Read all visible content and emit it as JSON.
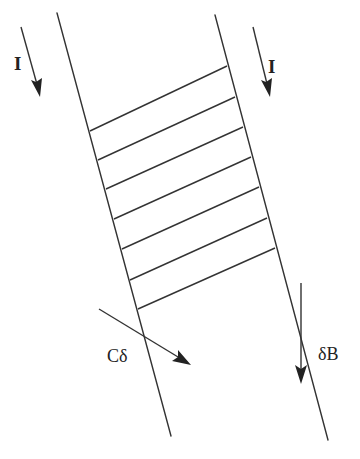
{
  "diagram": {
    "colors": {
      "stroke": "#333333",
      "background": "#ffffff"
    },
    "rails": [
      {
        "id": "left-rail",
        "x1": 57,
        "y1": 13,
        "x2": 171,
        "y2": 436
      },
      {
        "id": "right-rail",
        "x1": 215,
        "y1": 15,
        "x2": 328,
        "y2": 440
      }
    ],
    "rungs": [
      {
        "x1": 90,
        "y1": 131,
        "x2": 227,
        "y2": 66
      },
      {
        "x1": 98,
        "y1": 160,
        "x2": 235,
        "y2": 97
      },
      {
        "x1": 106,
        "y1": 189,
        "x2": 243,
        "y2": 127
      },
      {
        "x1": 114,
        "y1": 219,
        "x2": 251,
        "y2": 157
      },
      {
        "x1": 122,
        "y1": 249,
        "x2": 259,
        "y2": 187
      },
      {
        "x1": 130,
        "y1": 280,
        "x2": 267,
        "y2": 218
      },
      {
        "x1": 138,
        "y1": 309,
        "x2": 275,
        "y2": 248
      }
    ],
    "labels": {
      "current_left": "I",
      "current_right": "I",
      "c_delta": "Cδ",
      "delta_b": "δB"
    }
  }
}
